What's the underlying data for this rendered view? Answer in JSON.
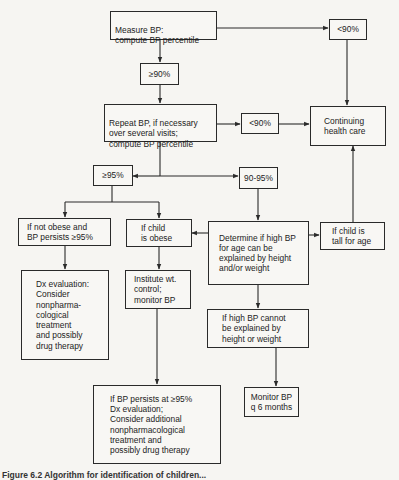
{
  "diagram": {
    "type": "flowchart",
    "nodes": {
      "measure_bp": "Measure BP:\ncompute BP percentile",
      "ge90": "≥90%",
      "lt90_top": "<90%",
      "repeat_bp": "Repeat BP, if necessary\nover several visits;\ncompute BP percentile",
      "lt90_mid": "<90%",
      "continuing_care": "Continuing\nhealth care",
      "ge95": "≥95%",
      "range_90_95": "90-95%",
      "not_obese": "If not obese and\nBP persists ≥95%",
      "child_obese": "If child\nis obese",
      "determine": "Determine if high BP\nfor age can be\nexplained by height\nand/or weight",
      "tall_for_age": "If child is\ntall for age",
      "dx_eval": "Dx evaluation:\nConsider\nnonpharma-\ncological\ntreatment\nand possibly\ndrug therapy",
      "institute_wt": "Institute wt.\ncontrol;\nmonitor BP",
      "cannot_explain": "If high BP cannot\nbe explained by\nheight or weight",
      "monitor_bp": "Monitor BP\nq 6 months",
      "persists_95": "If BP persists at ≥95%\nDx evaluation;\nConsider additional\nnonpharmacological\ntreatment and\npossibly drug therapy"
    },
    "edges": [
      {
        "from": "measure_bp",
        "to": "ge90"
      },
      {
        "from": "measure_bp",
        "to": "lt90_top"
      },
      {
        "from": "lt90_top",
        "to": "continuing_care"
      },
      {
        "from": "ge90",
        "to": "repeat_bp"
      },
      {
        "from": "repeat_bp",
        "to": "lt90_mid"
      },
      {
        "from": "lt90_mid",
        "to": "continuing_care"
      },
      {
        "from": "repeat_bp",
        "to": "ge95"
      },
      {
        "from": "repeat_bp",
        "to": "range_90_95"
      },
      {
        "from": "ge95",
        "to": "not_obese"
      },
      {
        "from": "ge95",
        "to": "child_obese"
      },
      {
        "from": "range_90_95",
        "to": "determine"
      },
      {
        "from": "determine",
        "to": "child_obese"
      },
      {
        "from": "determine",
        "to": "tall_for_age"
      },
      {
        "from": "tall_for_age",
        "to": "continuing_care"
      },
      {
        "from": "not_obese",
        "to": "dx_eval"
      },
      {
        "from": "child_obese",
        "to": "institute_wt"
      },
      {
        "from": "institute_wt",
        "to": "persists_95"
      },
      {
        "from": "determine",
        "to": "cannot_explain"
      },
      {
        "from": "cannot_explain",
        "to": "monitor_bp"
      }
    ],
    "caption": "Figure 6.2  Algorithm for identification of children..."
  },
  "colors": {
    "background": "#f6f5f2",
    "line": "#2a2a2a",
    "text": "#1c1c1c"
  }
}
